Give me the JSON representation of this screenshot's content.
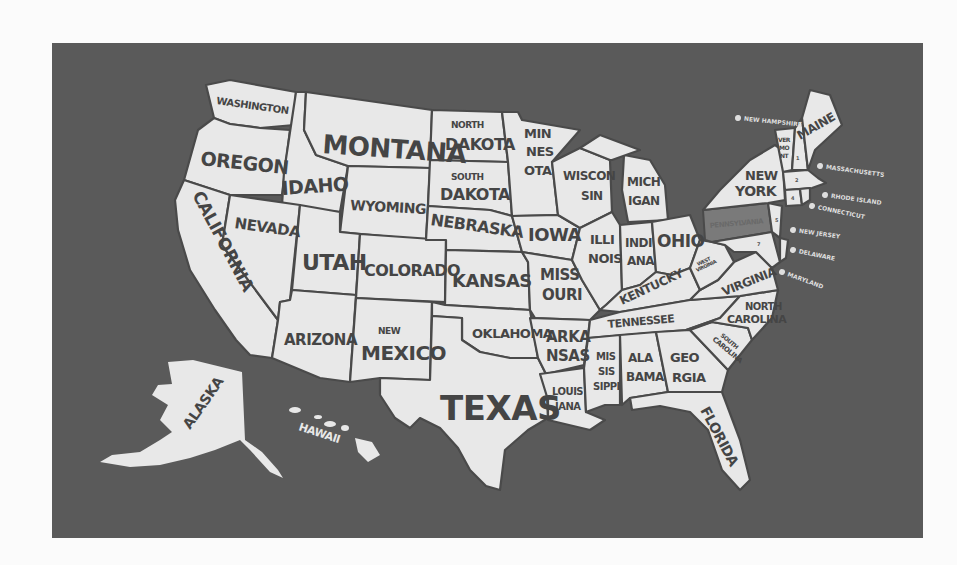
{
  "map": {
    "title": "United States of America",
    "background_color": "#5a5a5a",
    "land_color": "#e8e8e8",
    "border_color": "#4a4a4a",
    "highlighted_state": {
      "name": "Pennsylvania",
      "color": "#7a7a7a"
    },
    "states": {
      "washington": "WASHINGTON",
      "oregon": "OREGON",
      "california": "CALIFORNIA",
      "idaho": "IDAHO",
      "nevada": "NEVADA",
      "montana": "MONTANA",
      "wyoming": "WYOMING",
      "utah": "UTAH",
      "arizona": "ARIZONA",
      "colorado": "COLORADO",
      "new_mexico_top": "NEW",
      "new_mexico_bottom": "MEXICO",
      "north_dakota_top": "NORTH",
      "north_dakota_bottom": "DAKOTA",
      "south_dakota_top": "SOUTH",
      "south_dakota_bottom": "DAKOTA",
      "nebraska": "NEBRASKA",
      "kansas": "KANSAS",
      "oklahoma": "OKLAHOMA",
      "texas": "TEXAS",
      "minnesota_1": "MIN",
      "minnesota_2": "NES",
      "minnesota_3": "OTA",
      "iowa": "IOWA",
      "missouri_1": "MISS",
      "missouri_2": "OURI",
      "arkansas_1": "ARKA",
      "arkansas_2": "NSAS",
      "louisiana_1": "LOUIS",
      "louisiana_2": "IANA",
      "wisconsin_1": "WISCON",
      "wisconsin_2": "SIN",
      "illinois_1": "ILLI",
      "illinois_2": "NOIS",
      "michigan_1": "MICH",
      "michigan_2": "IGAN",
      "indiana_1": "INDI",
      "indiana_2": "ANA",
      "ohio": "OHIO",
      "kentucky": "KENTUCKY",
      "tennessee": "TENNESSEE",
      "mississippi_1": "MIS",
      "mississippi_2": "SIS",
      "mississippi_3": "SIPPI",
      "alabama_1": "ALA",
      "alabama_2": "BAMA",
      "georgia_1": "GEO",
      "georgia_2": "RGIA",
      "florida": "FLORIDA",
      "south_carolina_1": "SOUTH",
      "south_carolina_2": "CAROLINA",
      "north_carolina_1": "NORTH",
      "north_carolina_2": "CAROLINA",
      "virginia": "VIRGINIA",
      "west_virginia_1": "WEST",
      "west_virginia_2": "VIRGINIA",
      "pennsylvania": "PENNSYLVANIA",
      "new_york_1": "NEW",
      "new_york_2": "YORK",
      "vermont_1": "VER",
      "vermont_2": "MO",
      "vermont_3": "NT",
      "maine": "MAINE",
      "alaska": "ALASKA",
      "hawaii": "HAWAII"
    },
    "legend": [
      {
        "number": "1",
        "label": "NEW HAMPSHIRE"
      },
      {
        "number": "2",
        "label": "MASSACHUSETTS"
      },
      {
        "number": "3",
        "label": "RHODE ISLAND"
      },
      {
        "number": "4",
        "label": "CONNECTICUT"
      },
      {
        "number": "5",
        "label": "NEW JERSEY"
      },
      {
        "number": "6",
        "label": "DELAWARE"
      },
      {
        "number": "7",
        "label": "MARYLAND"
      }
    ]
  }
}
